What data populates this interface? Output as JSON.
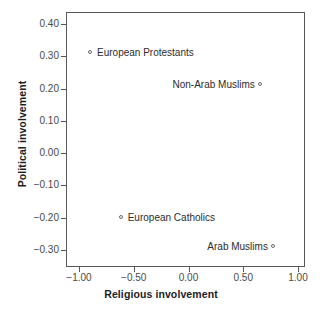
{
  "chart_data": {
    "type": "scatter",
    "title": "",
    "xlabel": "Religious involvement",
    "ylabel": "Political involvement",
    "xlim": [
      -1.09,
      1.09
    ],
    "ylim": [
      -0.345,
      0.445
    ],
    "grid": false,
    "legend": "none",
    "xticks": [
      "-1.00",
      "-0.50",
      "0.00",
      "0.50",
      "1.00"
    ],
    "xtick_values": [
      -1.0,
      -0.5,
      0.0,
      0.5,
      1.0
    ],
    "yticks": [
      "0.40",
      "0.30",
      "0.20",
      "0.10",
      "0.00",
      "-0.10",
      "-0.20",
      "-0.30"
    ],
    "ytick_values": [
      0.4,
      0.3,
      0.2,
      0.1,
      0.0,
      -0.1,
      -0.2,
      -0.3
    ],
    "marker": "open-circle",
    "points": [
      {
        "label": "European Protestants",
        "x": -0.89,
        "y": 0.31,
        "label_side": "right"
      },
      {
        "label": "Non-Arab Muslims",
        "x": 0.66,
        "y": 0.21,
        "label_side": "left"
      },
      {
        "label": "European Catholics",
        "x": -0.61,
        "y": -0.2,
        "label_side": "right"
      },
      {
        "label": "Arab Muslims",
        "x": 0.78,
        "y": -0.29,
        "label_side": "left"
      }
    ]
  },
  "colors": {
    "frame": "#58585a",
    "tick_text": "#4a4a4c",
    "axis_title": "#1d1d1f",
    "marker": "#6b6b6d",
    "point_label": "#2b2b2d",
    "background": "#ffffff"
  }
}
